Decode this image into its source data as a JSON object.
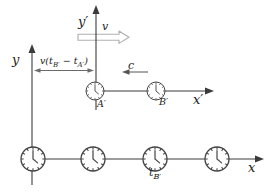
{
  "diagram": {
    "frame_S": {
      "x_axis_label": "x",
      "y_axis_label": "y",
      "clock_count": 4,
      "clock_time_label": {
        "base": "t",
        "sub": "B′"
      }
    },
    "frame_S_prime": {
      "x_axis_label": "x′",
      "y_axis_label": "y′",
      "velocity_label": "v",
      "light_signal_label": "c",
      "clock_labels": [
        "A′",
        "B′"
      ],
      "separation_label": {
        "prefix": "v(t",
        "sub_1": "B′",
        "mid": " − t",
        "sub_2": "A′",
        "suffix": ")"
      }
    },
    "colors": {
      "axis_line": "#3b3b3b",
      "velocity_arrow_outline": "#b0b0b0",
      "text": "#222222",
      "background": "#ffffff"
    }
  }
}
